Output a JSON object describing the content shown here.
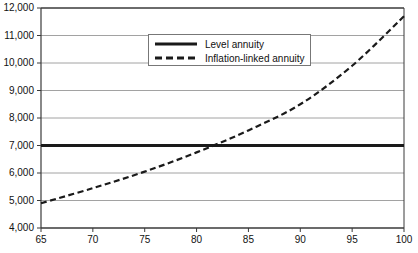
{
  "chart_data": {
    "type": "line",
    "title": "",
    "subtitle": "",
    "xlabel": "",
    "ylabel": "",
    "xlim": [
      65,
      100
    ],
    "ylim": [
      4000,
      12000
    ],
    "grid": true,
    "grid_axis": "y",
    "legend_position": "top-center",
    "x": [
      65,
      70,
      75,
      80,
      85,
      90,
      95,
      100
    ],
    "xticks": [
      "65",
      "70",
      "75",
      "80",
      "85",
      "90",
      "95",
      "100"
    ],
    "yticks": [
      "4,000",
      "5,000",
      "6,000",
      "7,000",
      "8,000",
      "9,000",
      "10,000",
      "11,000",
      "12,000"
    ],
    "ytick_values": [
      4000,
      5000,
      6000,
      7000,
      8000,
      9000,
      10000,
      11000,
      12000
    ],
    "series": [
      {
        "name": "Level annuity",
        "style": "solid",
        "color": "#1a1a1a",
        "width": 3,
        "values": [
          7000,
          7000,
          7000,
          7000,
          7000,
          7000,
          7000,
          7000
        ]
      },
      {
        "name": "Inflation-linked annuity",
        "style": "dashed",
        "color": "#1a1a1a",
        "width": 2.2,
        "values": [
          4900,
          5450,
          6050,
          6750,
          7550,
          8500,
          9900,
          11700
        ]
      }
    ],
    "annotations": [],
    "crossover_age": 80
  },
  "legend": {
    "entries": [
      {
        "label": "Level annuity",
        "style": "solid"
      },
      {
        "label": "Inflation-linked annuity",
        "style": "dashed"
      }
    ]
  },
  "colors": {
    "axis": "#3a3a3a",
    "grid": "#8a8a8a",
    "line": "#1a1a1a",
    "background": "#ffffff",
    "text": "#111111"
  }
}
